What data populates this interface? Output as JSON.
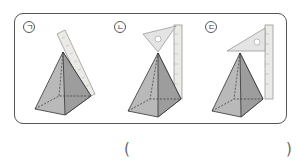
{
  "question": {
    "choices": [
      {
        "label": "ㄱ",
        "method": "ruler-leaning-on-face"
      },
      {
        "label": "ㄴ",
        "method": "triangle-ruler-tilted-with-vertical-ruler"
      },
      {
        "label": "ㄷ",
        "method": "triangle-ruler-horizontal-with-vertical-ruler"
      }
    ],
    "answer_open": "(",
    "answer_close": ")",
    "answer_value": ""
  }
}
